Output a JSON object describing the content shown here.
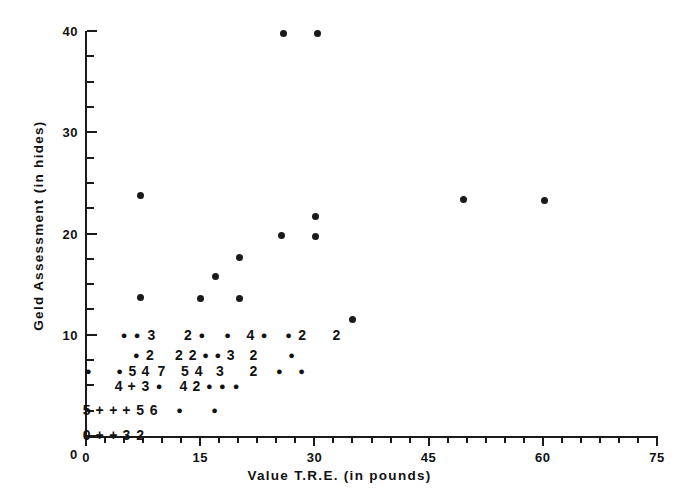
{
  "chart_data": {
    "type": "scatter",
    "title": "",
    "xlabel": "Value T.R.E. (in pounds)",
    "ylabel": "Geld Assessment (in hides)",
    "xlim": [
      0,
      75
    ],
    "ylim": [
      0,
      40
    ],
    "grid": false,
    "legend": null,
    "xticks": [
      0,
      15,
      30,
      45,
      60,
      75
    ],
    "yticks": [
      0,
      10,
      20,
      30,
      40
    ],
    "x_minor_step": 2.5,
    "y_minor_step": 2.5,
    "marker": "filled-circle",
    "marker_color": "#1a1a1a",
    "note": "Overprinted digits indicate the number of coincident observations at that location; '+' denotes more than 9.",
    "points": [
      {
        "x": 25.9,
        "y": 39.8
      },
      {
        "x": 30.4,
        "y": 39.8
      },
      {
        "x": 7.2,
        "y": 23.8
      },
      {
        "x": 49.6,
        "y": 23.4
      },
      {
        "x": 60.2,
        "y": 23.3
      },
      {
        "x": 30.2,
        "y": 21.7
      },
      {
        "x": 25.7,
        "y": 19.8
      },
      {
        "x": 30.2,
        "y": 19.7
      },
      {
        "x": 20.2,
        "y": 17.6
      },
      {
        "x": 17.0,
        "y": 15.8
      },
      {
        "x": 15.0,
        "y": 13.6
      },
      {
        "x": 20.2,
        "y": 13.6
      },
      {
        "x": 7.1,
        "y": 13.7
      },
      {
        "x": 35.0,
        "y": 11.5
      }
    ],
    "annotated_rows": [
      {
        "y": 10,
        "cells": [
          {
            "x": 5.0,
            "text": "●"
          },
          {
            "x": 6.7,
            "text": "●"
          },
          {
            "x": 8.6,
            "text": "3"
          },
          {
            "x": 13.4,
            "text": "2"
          },
          {
            "x": 15.2,
            "text": "●"
          },
          {
            "x": 18.6,
            "text": "●"
          },
          {
            "x": 21.6,
            "text": "4"
          },
          {
            "x": 23.4,
            "text": "●"
          },
          {
            "x": 26.6,
            "text": "●"
          },
          {
            "x": 28.4,
            "text": "2"
          },
          {
            "x": 32.9,
            "text": "2"
          }
        ]
      },
      {
        "y": 8,
        "cells": [
          {
            "x": 6.6,
            "text": "●"
          },
          {
            "x": 8.4,
            "text": "2"
          },
          {
            "x": 12.2,
            "text": "2"
          },
          {
            "x": 14.0,
            "text": "2"
          },
          {
            "x": 15.7,
            "text": "●"
          },
          {
            "x": 17.3,
            "text": "●"
          },
          {
            "x": 19.0,
            "text": "3"
          },
          {
            "x": 22.0,
            "text": "2"
          },
          {
            "x": 27.0,
            "text": "●"
          }
        ]
      },
      {
        "y": 6.4,
        "cells": [
          {
            "x": 0.3,
            "text": "●"
          },
          {
            "x": 4.4,
            "text": "●"
          },
          {
            "x": 6.1,
            "text": "5"
          },
          {
            "x": 7.8,
            "text": "4"
          },
          {
            "x": 9.9,
            "text": "7"
          },
          {
            "x": 13.0,
            "text": "5"
          },
          {
            "x": 14.8,
            "text": "4"
          },
          {
            "x": 17.6,
            "text": "3"
          },
          {
            "x": 22.0,
            "text": "2"
          },
          {
            "x": 25.4,
            "text": "●"
          },
          {
            "x": 28.3,
            "text": "●"
          }
        ]
      },
      {
        "y": 4.9,
        "cells": [
          {
            "x": 4.3,
            "text": "4"
          },
          {
            "x": 6.0,
            "text": "+"
          },
          {
            "x": 7.8,
            "text": "3"
          },
          {
            "x": 9.6,
            "text": "●"
          },
          {
            "x": 12.8,
            "text": "4"
          },
          {
            "x": 14.5,
            "text": "2"
          },
          {
            "x": 16.2,
            "text": "●"
          },
          {
            "x": 17.9,
            "text": "●"
          },
          {
            "x": 19.7,
            "text": "●"
          }
        ]
      },
      {
        "y": 2.6,
        "cells": [
          {
            "x": 0.1,
            "text": "5"
          },
          {
            "x": 1.8,
            "text": "+"
          },
          {
            "x": 3.6,
            "text": "+"
          },
          {
            "x": 5.3,
            "text": "+"
          },
          {
            "x": 7.1,
            "text": "5"
          },
          {
            "x": 8.9,
            "text": "6"
          },
          {
            "x": 12.3,
            "text": "●"
          },
          {
            "x": 16.9,
            "text": "●"
          }
        ]
      },
      {
        "y": 0.1,
        "cells": [
          {
            "x": 0.1,
            "text": "0"
          },
          {
            "x": 1.8,
            "text": "+"
          },
          {
            "x": 3.6,
            "text": "+"
          },
          {
            "x": 5.3,
            "text": "3"
          },
          {
            "x": 7.1,
            "text": "2"
          }
        ]
      }
    ]
  },
  "axes": {
    "x_title": "Value T.R.E. (in pounds)",
    "y_title": "Geld Assessment (in hides)",
    "x_tick_labels": [
      "0",
      "15",
      "30",
      "45",
      "60",
      "75"
    ],
    "y_tick_labels": [
      "0",
      "10",
      "20",
      "30",
      "40"
    ]
  },
  "colors": {
    "ink": "#1a1a1a",
    "background": "#ffffff"
  }
}
